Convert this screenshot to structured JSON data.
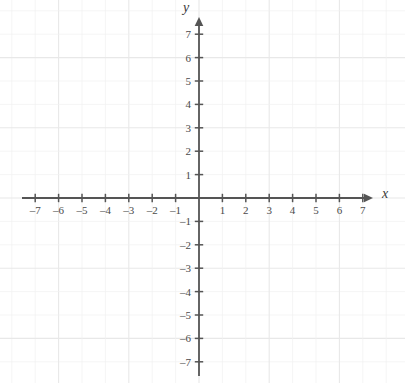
{
  "figure": {
    "kind": "cartesian-coordinate-plane",
    "title": "",
    "background_color": "#ffffff",
    "axis_color": "#555555",
    "label_color": "#4a4a4a",
    "grid_color": "#f0f0f0",
    "grid_major_color": "#e8e8e8"
  },
  "chart_data": {
    "type": "scatter",
    "title": "",
    "xlabel": "x",
    "ylabel": "y",
    "xlim": [
      -7.6,
      7.6
    ],
    "ylim": [
      -7.6,
      7.6
    ],
    "x_ticks": [
      -7,
      -6,
      -5,
      -4,
      -3,
      -2,
      -1,
      1,
      2,
      3,
      4,
      5,
      6,
      7
    ],
    "y_ticks": [
      7,
      6,
      5,
      4,
      3,
      2,
      1,
      -1,
      -2,
      -3,
      -4,
      -5,
      -6,
      -7
    ],
    "x_tick_labels": [
      "–7",
      "–6",
      "–5",
      "–4",
      "–3",
      "–2",
      "–1",
      "1",
      "2",
      "3",
      "4",
      "5",
      "6",
      "7"
    ],
    "y_tick_labels": [
      "7",
      "6",
      "5",
      "4",
      "3",
      "2",
      "1",
      "–1",
      "–2",
      "–3",
      "–4",
      "–5",
      "–6",
      "–7"
    ],
    "series": [],
    "values": [],
    "categories": [],
    "grid": true,
    "legend": false,
    "annotations": []
  },
  "axes": {
    "x_label": "x",
    "y_label": "y",
    "origin_label": "",
    "arrow_positive_x": true,
    "arrow_positive_y": true,
    "arrow_negative_x": false,
    "arrow_negative_y": false
  },
  "geometry": {
    "origin_x": 199,
    "origin_y": 198,
    "unit_px": 23.4,
    "x_axis_start_px": 22,
    "x_axis_end_px": 368,
    "y_axis_start_px": 22,
    "y_axis_end_px": 376
  }
}
